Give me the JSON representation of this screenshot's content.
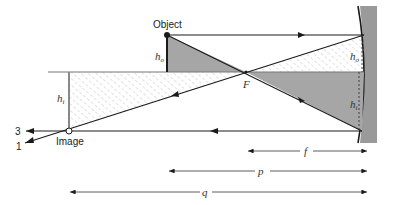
{
  "labels": {
    "object": "Object",
    "image": "Image",
    "focal_point": "F",
    "h_o_left": "h",
    "h_o_left_sub": "o",
    "h_i_left": "h",
    "h_i_left_sub": "i",
    "h_o_right": "h",
    "h_o_right_sub": "o",
    "h_i_right": "h",
    "h_i_right_sub": "i",
    "ray_3": "3",
    "ray_1": "1",
    "dim_f": "f",
    "dim_p": "p",
    "dim_q": "q"
  },
  "colors": {
    "line": "#1a1a1a",
    "mirror_gray": "#9a9a9a",
    "shaded_gray": "#a6a6a6",
    "hatch": "#b8b8b8"
  },
  "geometry": {
    "optical_axis_y": 72,
    "object_x": 167,
    "object_top_y": 35,
    "focal_x": 246,
    "image_x": 68,
    "image_y": 131,
    "mirror_x": 364
  }
}
